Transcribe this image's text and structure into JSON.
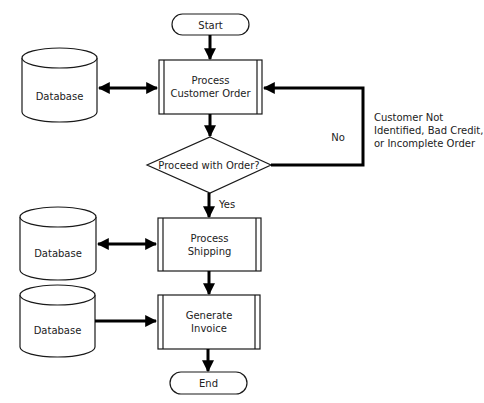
{
  "diagram": {
    "type": "flowchart",
    "colors": {
      "stroke": "#000000",
      "fill": "#ffffff",
      "text": "#222222"
    },
    "nodes": {
      "start": {
        "shape": "terminator",
        "label": "Start"
      },
      "process_order": {
        "shape": "predefined-process",
        "line1": "Process",
        "line2": "Customer Order"
      },
      "decision": {
        "shape": "decision",
        "label": "Proceed with Order?"
      },
      "process_shipping": {
        "shape": "predefined-process",
        "line1": "Process",
        "line2": "Shipping"
      },
      "generate_invoice": {
        "shape": "predefined-process",
        "line1": "Generate",
        "line2": "Invoice"
      },
      "end": {
        "shape": "terminator",
        "label": "End"
      },
      "db1": {
        "shape": "database",
        "label": "Database"
      },
      "db2": {
        "shape": "database",
        "label": "Database"
      },
      "db3": {
        "shape": "database",
        "label": "Database"
      }
    },
    "edges": [
      {
        "from": "start",
        "to": "process_order",
        "label": ""
      },
      {
        "from": "db1",
        "to": "process_order",
        "label": "",
        "bidirectional": true
      },
      {
        "from": "process_order",
        "to": "decision",
        "label": ""
      },
      {
        "from": "decision",
        "to": "process_order",
        "label": "No"
      },
      {
        "from": "decision",
        "to": "process_shipping",
        "label": "Yes"
      },
      {
        "from": "db2",
        "to": "process_shipping",
        "label": "",
        "bidirectional": true
      },
      {
        "from": "process_shipping",
        "to": "generate_invoice",
        "label": ""
      },
      {
        "from": "db3",
        "to": "generate_invoice",
        "label": ""
      },
      {
        "from": "generate_invoice",
        "to": "end",
        "label": ""
      }
    ],
    "edge_labels": {
      "no": "No",
      "yes": "Yes"
    },
    "annotation": {
      "line1": "Customer Not",
      "line2": "Identified, Bad Credit,",
      "line3": "or Incomplete Order"
    }
  }
}
